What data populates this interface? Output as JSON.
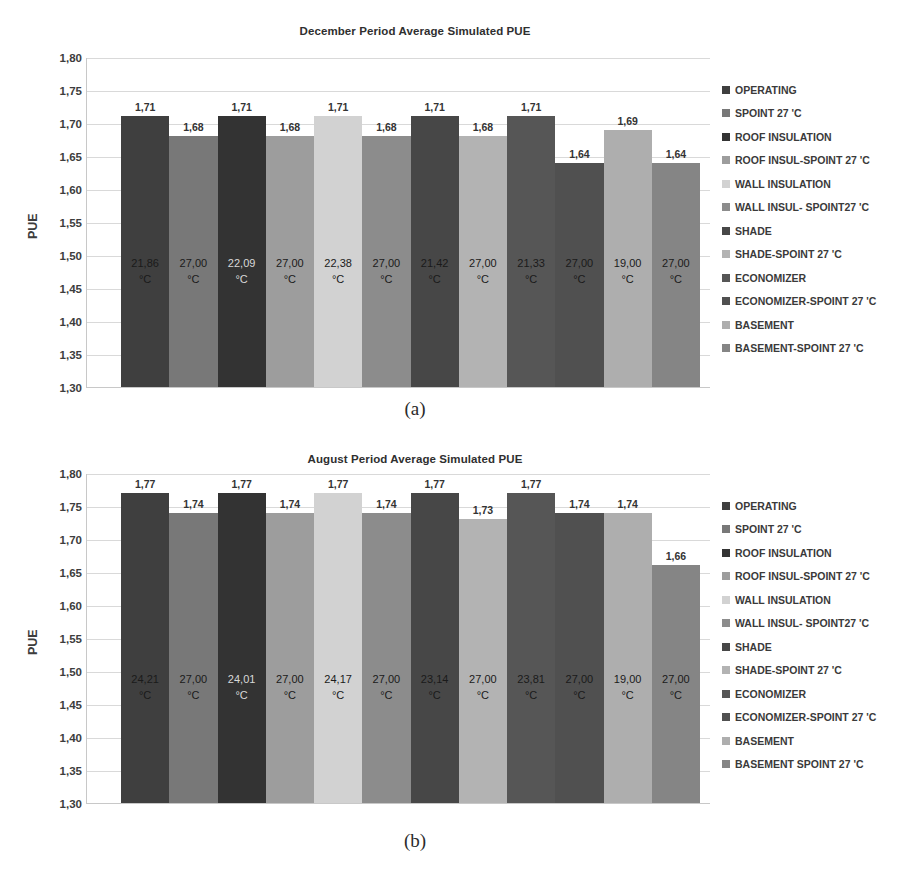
{
  "figures": [
    {
      "id": "a",
      "caption": "(a)",
      "title": "December Period Average Simulated PUE"
    },
    {
      "id": "b",
      "caption": "(b)",
      "title": "August Period Average Simulated PUE"
    }
  ],
  "chart_data": [
    {
      "type": "bar",
      "title": "December Period Average Simulated PUE",
      "caption": "(a)",
      "xlabel": "",
      "ylabel": "PUE",
      "ylim": [
        1.3,
        1.8
      ],
      "ytick_labels": [
        "1,80",
        "1,75",
        "1,70",
        "1,65",
        "1,60",
        "1,55",
        "1,50",
        "1,45",
        "1,40",
        "1,35",
        "1,30"
      ],
      "ytick_values": [
        1.8,
        1.75,
        1.7,
        1.65,
        1.6,
        1.55,
        1.5,
        1.45,
        1.4,
        1.35,
        1.3
      ],
      "grid": true,
      "legend_position": "right",
      "categories": [
        "OPERATING",
        "SPOINT 27 'C",
        "ROOF INSULATION",
        "ROOF INSUL-SPOINT 27 'C",
        "WALL INSULATION",
        "WALL INSUL- SPOINT27 'C",
        "SHADE",
        "SHADE-SPOINT 27 'C",
        "ECONOMIZER",
        "ECONOMIZER-SPOINT 27 'C",
        "BASEMENT",
        "BASEMENT-SPOINT 27 'C"
      ],
      "values": [
        1.71,
        1.68,
        1.71,
        1.68,
        1.71,
        1.68,
        1.71,
        1.68,
        1.71,
        1.64,
        1.69,
        1.64
      ],
      "value_labels": [
        "1,71",
        "1,68",
        "1,71",
        "1,68",
        "1,71",
        "1,68",
        "1,71",
        "1,68",
        "1,71",
        "1,64",
        "1,69",
        "1,64"
      ],
      "temperature_labels": [
        "21,86",
        "27,00",
        "22,09",
        "27,00",
        "22,38",
        "27,00",
        "21,42",
        "27,00",
        "21,33",
        "27,00",
        "19,00",
        "27,00"
      ],
      "temperature_unit": "°C",
      "colors": [
        "#3f3f3f",
        "#787878",
        "#333333",
        "#9d9d9d",
        "#d2d2d2",
        "#8c8c8c",
        "#474747",
        "#b3b3b3",
        "#565656",
        "#505050",
        "#aeaeae",
        "#858585"
      ],
      "label_text_colors": [
        "#1a1a1a",
        "#1a1a1a",
        "#d8d8d8",
        "#1a1a1a",
        "#1a1a1a",
        "#1a1a1a",
        "#1a1a1a",
        "#1a1a1a",
        "#1a1a1a",
        "#1a1a1a",
        "#1a1a1a",
        "#1a1a1a"
      ]
    },
    {
      "type": "bar",
      "title": "August Period Average Simulated PUE",
      "caption": "(b)",
      "xlabel": "",
      "ylabel": "PUE",
      "ylim": [
        1.3,
        1.8
      ],
      "ytick_labels": [
        "1,80",
        "1,75",
        "1,70",
        "1,65",
        "1,60",
        "1,55",
        "1,50",
        "1,45",
        "1,40",
        "1,35",
        "1,30"
      ],
      "ytick_values": [
        1.8,
        1.75,
        1.7,
        1.65,
        1.6,
        1.55,
        1.5,
        1.45,
        1.4,
        1.35,
        1.3
      ],
      "grid": true,
      "legend_position": "right",
      "categories": [
        "OPERATING",
        "SPOINT 27 'C",
        "ROOF INSULATION",
        "ROOF INSUL-SPOINT 27 'C",
        "WALL INSULATION",
        "WALL INSUL- SPOINT27 'C",
        "SHADE",
        "SHADE-SPOINT 27 'C",
        "ECONOMIZER",
        "ECONOMIZER-SPOINT 27 'C",
        "BASEMENT",
        "BASEMENT SPOINT 27 'C"
      ],
      "values": [
        1.77,
        1.74,
        1.77,
        1.74,
        1.77,
        1.74,
        1.77,
        1.73,
        1.77,
        1.74,
        1.74,
        1.66
      ],
      "value_labels": [
        "1,77",
        "1,74",
        "1,77",
        "1,74",
        "1,77",
        "1,74",
        "1,77",
        "1,73",
        "1,77",
        "1,74",
        "1,74",
        "1,66"
      ],
      "temperature_labels": [
        "24,21",
        "27,00",
        "24,01",
        "27,00",
        "24,17",
        "27,00",
        "23,14",
        "27,00",
        "23,81",
        "27,00",
        "19,00",
        "27,00"
      ],
      "temperature_unit": "°C",
      "colors": [
        "#3f3f3f",
        "#787878",
        "#333333",
        "#9d9d9d",
        "#d2d2d2",
        "#8c8c8c",
        "#474747",
        "#b3b3b3",
        "#565656",
        "#505050",
        "#aeaeae",
        "#858585"
      ],
      "label_text_colors": [
        "#1a1a1a",
        "#1a1a1a",
        "#d8d8d8",
        "#1a1a1a",
        "#1a1a1a",
        "#1a1a1a",
        "#1a1a1a",
        "#1a1a1a",
        "#1a1a1a",
        "#1a1a1a",
        "#1a1a1a",
        "#1a1a1a"
      ]
    }
  ]
}
